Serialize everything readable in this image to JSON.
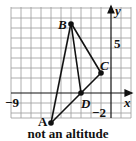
{
  "figure": {
    "caption": "not an altitude",
    "axes": {
      "x_label": "x",
      "y_label": "y",
      "x_tick_label": "−9",
      "y_tick_label": "5",
      "x_neg_label": "−2",
      "grid": true,
      "xlim": [
        -10,
        2
      ],
      "ylim": [
        -2.5,
        8.5
      ]
    },
    "points": [
      {
        "label": "A",
        "x": -6,
        "y": -3
      },
      {
        "label": "B",
        "x": -4,
        "y": 7
      },
      {
        "label": "C",
        "x": -1,
        "y": 2
      },
      {
        "label": "D",
        "x": -3,
        "y": 0
      }
    ],
    "segments": [
      [
        "A",
        "B"
      ],
      [
        "B",
        "C"
      ],
      [
        "A",
        "C"
      ],
      [
        "B",
        "D"
      ]
    ],
    "colors": {
      "ink": "#111111",
      "grid": "#9a9a9a",
      "background": "#ffffff"
    }
  }
}
